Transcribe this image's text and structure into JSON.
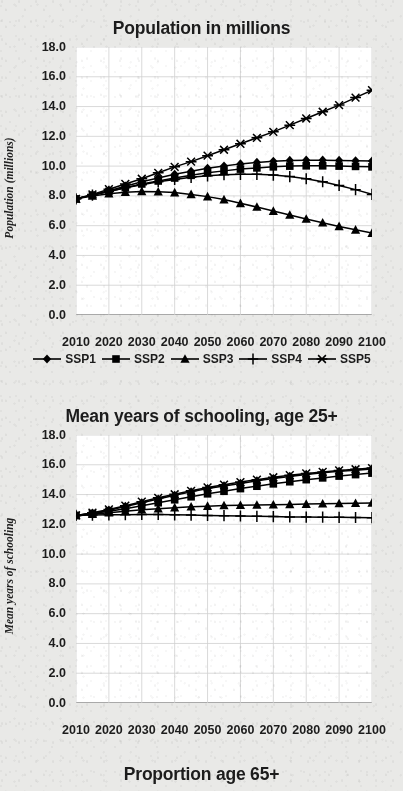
{
  "document": {
    "background_color": "#e9e9e7",
    "plot_background_color": "#ffffff",
    "series_color": "#000000",
    "gridline_color": "#cfcfcf"
  },
  "legend": {
    "items": [
      {
        "label": "SSP1",
        "marker": "diamond-marker"
      },
      {
        "label": "SSP2",
        "marker": "square-marker"
      },
      {
        "label": "SSP3",
        "marker": "triangle-marker"
      },
      {
        "label": "SSP4",
        "marker": "plus-marker"
      },
      {
        "label": "SSP5",
        "marker": "asterisk-marker"
      }
    ]
  },
  "panels": [
    {
      "id": "population",
      "title": "Population in millions"
    },
    {
      "id": "schooling",
      "title": "Mean years of schooling, age 25+"
    },
    {
      "id": "proportion",
      "title": "Proportion age 65+"
    }
  ],
  "chart_data": [
    {
      "type": "line",
      "title": "Population in millions",
      "xlabel": "",
      "ylabel": "Population (millions)",
      "ylim": [
        0.0,
        18.0
      ],
      "ytick_step": 2.0,
      "yticks": [
        "0.0",
        "2.0",
        "4.0",
        "6.0",
        "8.0",
        "10.0",
        "12.0",
        "14.0",
        "16.0",
        "18.0"
      ],
      "xlim": [
        2010,
        2100
      ],
      "xticks": [
        "2010",
        "2020",
        "2030",
        "2040",
        "2050",
        "2060",
        "2070",
        "2080",
        "2090",
        "2100"
      ],
      "grid": true,
      "legend_position": "below",
      "x": [
        2010,
        2015,
        2020,
        2025,
        2030,
        2035,
        2040,
        2045,
        2050,
        2055,
        2060,
        2065,
        2070,
        2075,
        2080,
        2085,
        2090,
        2095,
        2100
      ],
      "series": [
        {
          "name": "SSP1",
          "marker": "diamond",
          "values": [
            7.8,
            8.05,
            8.35,
            8.65,
            8.95,
            9.2,
            9.45,
            9.65,
            9.85,
            10.0,
            10.15,
            10.25,
            10.32,
            10.38,
            10.4,
            10.4,
            10.38,
            10.36,
            10.34
          ]
        },
        {
          "name": "SSP2",
          "marker": "square",
          "values": [
            7.8,
            8.05,
            8.3,
            8.55,
            8.8,
            9.0,
            9.2,
            9.38,
            9.55,
            9.68,
            9.8,
            9.88,
            9.95,
            10.0,
            10.02,
            10.02,
            10.0,
            9.98,
            9.95
          ]
        },
        {
          "name": "SSP3",
          "marker": "triangle",
          "values": [
            7.8,
            8.0,
            8.15,
            8.25,
            8.3,
            8.28,
            8.22,
            8.1,
            7.95,
            7.75,
            7.5,
            7.25,
            6.98,
            6.72,
            6.45,
            6.2,
            5.95,
            5.72,
            5.5
          ]
        },
        {
          "name": "SSP4",
          "marker": "plus",
          "values": [
            7.8,
            8.05,
            8.3,
            8.55,
            8.75,
            8.95,
            9.1,
            9.25,
            9.35,
            9.42,
            9.45,
            9.45,
            9.4,
            9.3,
            9.15,
            8.95,
            8.7,
            8.42,
            8.1
          ]
        },
        {
          "name": "SSP5",
          "marker": "asterisk",
          "values": [
            7.8,
            8.1,
            8.45,
            8.8,
            9.15,
            9.55,
            9.95,
            10.3,
            10.7,
            11.1,
            11.5,
            11.9,
            12.3,
            12.75,
            13.2,
            13.65,
            14.1,
            14.6,
            15.1
          ]
        }
      ]
    },
    {
      "type": "line",
      "title": "Mean years of schooling, age 25+",
      "xlabel": "",
      "ylabel": "Mean years of schooling",
      "ylim": [
        0.0,
        18.0
      ],
      "ytick_step": 2.0,
      "yticks": [
        "0.0",
        "2.0",
        "4.0",
        "6.0",
        "8.0",
        "10.0",
        "12.0",
        "14.0",
        "16.0",
        "18.0"
      ],
      "xlim": [
        2010,
        2100
      ],
      "xticks": [
        "2010",
        "2020",
        "2030",
        "2040",
        "2050",
        "2060",
        "2070",
        "2080",
        "2090",
        "2100"
      ],
      "grid": true,
      "legend_position": "none",
      "x": [
        2010,
        2015,
        2020,
        2025,
        2030,
        2035,
        2040,
        2045,
        2050,
        2055,
        2060,
        2065,
        2070,
        2075,
        2080,
        2085,
        2090,
        2095,
        2100
      ],
      "series": [
        {
          "name": "SSP1",
          "marker": "diamond",
          "values": [
            12.6,
            12.75,
            12.95,
            13.2,
            13.45,
            13.7,
            13.95,
            14.18,
            14.4,
            14.58,
            14.75,
            14.92,
            15.08,
            15.22,
            15.35,
            15.46,
            15.56,
            15.64,
            15.72
          ]
        },
        {
          "name": "SSP2",
          "marker": "square",
          "values": [
            12.6,
            12.72,
            12.88,
            13.05,
            13.25,
            13.45,
            13.65,
            13.85,
            14.05,
            14.22,
            14.4,
            14.56,
            14.72,
            14.86,
            15.0,
            15.12,
            15.24,
            15.34,
            15.44
          ]
        },
        {
          "name": "SSP3",
          "marker": "triangle",
          "values": [
            12.6,
            12.68,
            12.78,
            12.88,
            12.98,
            13.05,
            13.12,
            13.18,
            13.22,
            13.26,
            13.28,
            13.3,
            13.32,
            13.34,
            13.36,
            13.38,
            13.4,
            13.42,
            13.44
          ]
        },
        {
          "name": "SSP4",
          "marker": "plus",
          "values": [
            12.6,
            12.62,
            12.64,
            12.65,
            12.66,
            12.66,
            12.64,
            12.62,
            12.6,
            12.58,
            12.56,
            12.54,
            12.52,
            12.5,
            12.49,
            12.48,
            12.47,
            12.46,
            12.45
          ]
        },
        {
          "name": "SSP5",
          "marker": "asterisk",
          "values": [
            12.6,
            12.78,
            13.0,
            13.25,
            13.52,
            13.78,
            14.02,
            14.25,
            14.48,
            14.66,
            14.84,
            15.0,
            15.16,
            15.3,
            15.42,
            15.52,
            15.62,
            15.7,
            15.78
          ]
        }
      ]
    }
  ]
}
